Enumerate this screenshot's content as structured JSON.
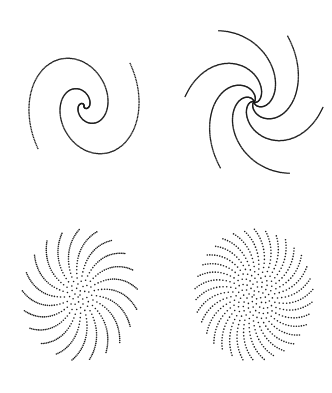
{
  "figure": {
    "width": 332,
    "height": 393,
    "background": "#ffffff",
    "dot_color": "#1a1a1a",
    "panels": [
      {
        "id": "top-left",
        "kind": "arm_spiral",
        "cx": 84,
        "cy": 106,
        "arms": 2,
        "turns": 1.55,
        "max_r": 78,
        "squash_x": 0.78,
        "rotation_deg": -20,
        "dots_per_arm": 230,
        "dot_r": 0.75,
        "direction": -1
      },
      {
        "id": "top-right",
        "kind": "arm_spiral",
        "cx": 254,
        "cy": 102,
        "arms": 6,
        "turns": 0.62,
        "max_r": 80,
        "squash_x": 0.85,
        "rotation_deg": -15,
        "dots_per_arm": 140,
        "dot_r": 0.75,
        "direction": -1
      },
      {
        "id": "bottom-left",
        "kind": "phyllotaxis",
        "cx": 80,
        "cy": 295,
        "count": 520,
        "max_r": 66,
        "squash_x": 0.88,
        "rotation_deg": 0,
        "angle_deg": 137.2,
        "dot_r": 0.8
      },
      {
        "id": "bottom-right",
        "kind": "phyllotaxis",
        "cx": 254,
        "cy": 295,
        "count": 560,
        "max_r": 66,
        "squash_x": 0.9,
        "rotation_deg": 0,
        "angle_deg": 137.6,
        "dot_r": 0.8
      }
    ]
  }
}
